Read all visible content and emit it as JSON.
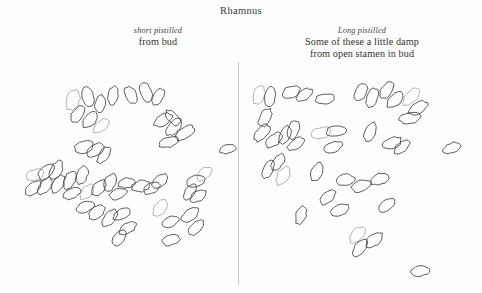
{
  "page": {
    "title": "Rhamnus",
    "background_color": "#fefefe",
    "ink_color": "#4a4a4a",
    "divider_color": "#c9c9c9"
  },
  "columns": {
    "left": {
      "species_note": "short pistilled",
      "source_line": "from bud",
      "extra_line": ""
    },
    "right": {
      "species_note": "Long pistilled",
      "source_line": "Some of these a little damp",
      "extra_line": "from open stamen in bud"
    }
  },
  "sketch": {
    "description": "hand-drawn pollen grain outlines",
    "left_group_count": 46,
    "right_group_count": 39,
    "left_grains": [
      [
        73,
        100,
        6.5,
        10.5,
        18
      ],
      [
        88,
        97,
        6.0,
        10.0,
        -10
      ],
      [
        100,
        104,
        5.0,
        9.0,
        12
      ],
      [
        113,
        96,
        5.0,
        9.5,
        8
      ],
      [
        131,
        95,
        5.5,
        9.5,
        -28
      ],
      [
        146,
        92,
        5.5,
        10.5,
        -18
      ],
      [
        158,
        97,
        5.0,
        9.0,
        30
      ],
      [
        78,
        114,
        5.5,
        9.5,
        35
      ],
      [
        90,
        120,
        5.5,
        9.5,
        42
      ],
      [
        101,
        126,
        5.0,
        9.0,
        48
      ],
      [
        163,
        120,
        5.5,
        10.0,
        62
      ],
      [
        174,
        127,
        5.5,
        10.0,
        40
      ],
      [
        173,
        118,
        5.0,
        9.5,
        -40
      ],
      [
        185,
        133,
        5.5,
        10.5,
        55
      ],
      [
        169,
        142,
        5.0,
        10.5,
        75
      ],
      [
        84,
        147,
        6.0,
        9.5,
        78
      ],
      [
        95,
        150,
        5.5,
        9.5,
        60
      ],
      [
        104,
        155,
        5.0,
        9.5,
        35
      ],
      [
        35,
        175,
        5.5,
        9.0,
        72
      ],
      [
        46,
        172,
        6.0,
        9.5,
        40
      ],
      [
        56,
        170,
        5.5,
        10.0,
        28
      ],
      [
        33,
        188,
        5.5,
        9.5,
        50
      ],
      [
        45,
        186,
        5.5,
        10.0,
        38
      ],
      [
        58,
        184,
        5.5,
        10.0,
        30
      ],
      [
        70,
        180,
        5.5,
        10.0,
        25
      ],
      [
        82,
        175,
        5.5,
        9.5,
        20
      ],
      [
        72,
        193,
        5.0,
        9.0,
        62
      ],
      [
        87,
        192,
        5.0,
        9.0,
        40
      ],
      [
        99,
        188,
        5.5,
        9.5,
        35
      ],
      [
        110,
        183,
        5.5,
        9.5,
        18
      ],
      [
        118,
        194,
        5.0,
        9.0,
        70
      ],
      [
        127,
        183,
        5.0,
        9.0,
        82
      ],
      [
        141,
        186,
        5.5,
        9.5,
        80
      ],
      [
        152,
        188,
        5.0,
        9.0,
        60
      ],
      [
        160,
        181,
        5.0,
        9.0,
        50
      ],
      [
        196,
        181,
        5.5,
        9.5,
        75
      ],
      [
        204,
        174,
        5.0,
        9.0,
        45
      ],
      [
        190,
        192,
        5.0,
        9.0,
        35
      ],
      [
        198,
        196,
        5.0,
        9.0,
        58
      ],
      [
        85,
        207,
        5.0,
        9.0,
        70
      ],
      [
        97,
        212,
        5.5,
        9.5,
        50
      ],
      [
        110,
        218,
        5.5,
        10.0,
        40
      ],
      [
        122,
        214,
        5.0,
        9.5,
        62
      ],
      [
        128,
        228,
        5.0,
        9.5,
        55
      ],
      [
        119,
        238,
        5.0,
        9.5,
        40
      ],
      [
        160,
        208,
        5.5,
        10.0,
        32
      ],
      [
        170,
        222,
        5.0,
        9.0,
        68
      ],
      [
        190,
        215,
        5.5,
        10.0,
        50
      ],
      [
        196,
        228,
        5.0,
        9.5,
        45
      ],
      [
        171,
        240,
        5.0,
        9.0,
        72
      ],
      [
        228,
        149,
        4.5,
        8.5,
        78
      ]
    ],
    "right_grains": [
      [
        259,
        95,
        5.5,
        9.5,
        18
      ],
      [
        270,
        97,
        5.5,
        10.0,
        12
      ],
      [
        291,
        92,
        5.5,
        9.5,
        70
      ],
      [
        304,
        95,
        5.0,
        9.0,
        55
      ],
      [
        325,
        99,
        5.0,
        10.0,
        82
      ],
      [
        361,
        92,
        5.5,
        9.5,
        30
      ],
      [
        372,
        98,
        5.5,
        10.0,
        20
      ],
      [
        387,
        90,
        5.5,
        9.5,
        35
      ],
      [
        395,
        100,
        5.5,
        10.0,
        48
      ],
      [
        411,
        97,
        5.5,
        10.5,
        40
      ],
      [
        418,
        108,
        5.5,
        10.5,
        62
      ],
      [
        410,
        118,
        5.5,
        10.5,
        80
      ],
      [
        265,
        118,
        5.5,
        10.0,
        30
      ],
      [
        262,
        133,
        5.5,
        10.0,
        40
      ],
      [
        274,
        140,
        5.5,
        10.0,
        52
      ],
      [
        285,
        135,
        5.0,
        9.5,
        28
      ],
      [
        293,
        130,
        5.5,
        9.5,
        20
      ],
      [
        296,
        144,
        5.0,
        9.5,
        58
      ],
      [
        321,
        133,
        5.5,
        10.0,
        75
      ],
      [
        336,
        131,
        5.5,
        10.0,
        80
      ],
      [
        333,
        147,
        5.0,
        9.5,
        70
      ],
      [
        370,
        132,
        5.5,
        10.0,
        24
      ],
      [
        392,
        143,
        5.5,
        10.0,
        72
      ],
      [
        402,
        147,
        5.0,
        9.5,
        50
      ],
      [
        452,
        148,
        5.0,
        9.5,
        68
      ],
      [
        278,
        162,
        5.0,
        9.5,
        35
      ],
      [
        268,
        169,
        5.0,
        9.5,
        22
      ],
      [
        283,
        176,
        5.5,
        10.0,
        30
      ],
      [
        317,
        172,
        5.5,
        10.0,
        18
      ],
      [
        345,
        180,
        5.5,
        9.5,
        78
      ],
      [
        361,
        186,
        5.5,
        10.0,
        72
      ],
      [
        380,
        179,
        5.5,
        10.0,
        72
      ],
      [
        301,
        215,
        5.0,
        9.5,
        20
      ],
      [
        328,
        197,
        5.0,
        9.5,
        45
      ],
      [
        340,
        210,
        5.0,
        9.5,
        68
      ],
      [
        387,
        205,
        5.0,
        9.5,
        55
      ],
      [
        357,
        235,
        5.5,
        10.0,
        40
      ],
      [
        360,
        248,
        5.5,
        10.0,
        38
      ],
      [
        374,
        240,
        5.5,
        10.0,
        50
      ],
      [
        420,
        271,
        5.0,
        9.0,
        84
      ]
    ]
  }
}
